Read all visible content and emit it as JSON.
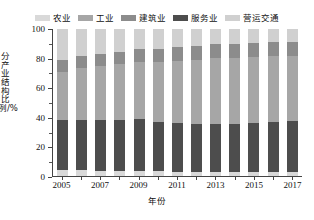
{
  "chart_data": {
    "type": "bar",
    "title": "",
    "subtitle": "",
    "xlabel": "年份",
    "ylabel": "分产业结构比例/%",
    "stacked": true,
    "normalized_percent": true,
    "grid": false,
    "legend_position": "top",
    "ylim": [
      0,
      100
    ],
    "yticks": [
      0,
      20,
      40,
      60,
      80,
      100
    ],
    "ytick_labels": [
      "0",
      "20",
      "40",
      "60",
      "80",
      "100"
    ],
    "xtick_labels": [
      "2005",
      "2007",
      "2009",
      "2011",
      "2013",
      "2015",
      "2017"
    ],
    "categories": [
      "2005",
      "2006",
      "2007",
      "2008",
      "2009",
      "2010",
      "2011",
      "2012",
      "2013",
      "2014",
      "2015",
      "2016",
      "2017"
    ],
    "series": [
      {
        "name": "农业",
        "color": "#d9d9d9",
        "values": [
          3.8,
          3.9,
          3.7,
          3.6,
          3.4,
          3.2,
          3.0,
          2.9,
          2.8,
          2.7,
          2.6,
          2.5,
          2.4
        ]
      },
      {
        "name": "服务业",
        "color": "#4d4d4d",
        "values": [
          34.2,
          34.3,
          34.2,
          34.4,
          35.2,
          33.7,
          32.8,
          32.4,
          32.5,
          32.8,
          33.4,
          34.0,
          35.1
        ]
      },
      {
        "name": "工业",
        "color": "#a6a6a6",
        "values": [
          33.0,
          35.2,
          36.9,
          38.2,
          39.1,
          41.0,
          42.7,
          43.9,
          44.7,
          45.0,
          45.0,
          44.9,
          44.0
        ]
      },
      {
        "name": "建筑业",
        "color": "#8c8c8c",
        "values": [
          8.0,
          8.1,
          8.2,
          8.4,
          8.5,
          8.7,
          9.0,
          9.3,
          9.5,
          9.6,
          9.7,
          9.8,
          9.8
        ]
      },
      {
        "name": "营运交通",
        "color": "#d0d0d0",
        "values": [
          21.0,
          18.5,
          17.0,
          15.4,
          13.8,
          13.4,
          12.5,
          11.5,
          10.5,
          9.9,
          9.3,
          8.8,
          8.7
        ]
      }
    ]
  },
  "legend": {
    "items": [
      {
        "label": "农业",
        "color": "#d9d9d9"
      },
      {
        "label": "工业",
        "color": "#a6a6a6"
      },
      {
        "label": "建筑业",
        "color": "#8c8c8c"
      },
      {
        "label": "服务业",
        "color": "#4d4d4d"
      },
      {
        "label": "营运交通",
        "color": "#d0d0d0"
      }
    ]
  },
  "axes": {
    "y_title": "分产业结构比例/%",
    "x_title": "年份"
  }
}
